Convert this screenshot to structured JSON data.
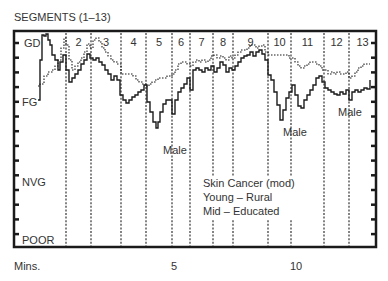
{
  "chart_data": {
    "type": "line",
    "title": "SEGMENTS (1–13)",
    "xlabel": "Mins.",
    "ylabel": "",
    "x_ticks": [
      {
        "label": "5",
        "x": 175
      },
      {
        "label": "10",
        "x": 297
      }
    ],
    "y_levels": [
      {
        "label": "GD",
        "y": 43
      },
      {
        "label": "FG",
        "y": 102
      },
      {
        "label": "NVG",
        "y": 182
      },
      {
        "label": "POOR",
        "y": 240
      }
    ],
    "segments": [
      {
        "label": "",
        "x": 14
      },
      {
        "label": "2",
        "x": 66
      },
      {
        "label": "3",
        "x": 91
      },
      {
        "label": "4",
        "x": 121
      },
      {
        "label": "5",
        "x": 146
      },
      {
        "label": "6",
        "x": 172
      },
      {
        "label": "7",
        "x": 190
      },
      {
        "label": "8",
        "x": 213
      },
      {
        "label": "9",
        "x": 233
      },
      {
        "label": "10",
        "x": 268
      },
      {
        "label": "11",
        "x": 291
      },
      {
        "label": "12",
        "x": 324
      },
      {
        "label": "13",
        "x": 349
      }
    ],
    "grid": false,
    "series": [
      {
        "name": "Male",
        "style": "solid",
        "points": [
          [
            38,
            100
          ],
          [
            40,
            60
          ],
          [
            42,
            35
          ],
          [
            44,
            36
          ],
          [
            46,
            34
          ],
          [
            48,
            40
          ],
          [
            50,
            45
          ],
          [
            52,
            55
          ],
          [
            55,
            60
          ],
          [
            58,
            70
          ],
          [
            60,
            62
          ],
          [
            63,
            55
          ],
          [
            66,
            70
          ],
          [
            69,
            82
          ],
          [
            72,
            78
          ],
          [
            75,
            74
          ],
          [
            78,
            70
          ],
          [
            81,
            64
          ],
          [
            84,
            60
          ],
          [
            87,
            54
          ],
          [
            90,
            58
          ],
          [
            93,
            60
          ],
          [
            96,
            58
          ],
          [
            99,
            62
          ],
          [
            102,
            65
          ],
          [
            105,
            70
          ],
          [
            108,
            74
          ],
          [
            111,
            80
          ],
          [
            114,
            76
          ],
          [
            117,
            80
          ],
          [
            120,
            95
          ],
          [
            123,
            100
          ],
          [
            126,
            103
          ],
          [
            129,
            100
          ],
          [
            132,
            97
          ],
          [
            135,
            95
          ],
          [
            138,
            92
          ],
          [
            141,
            90
          ],
          [
            144,
            85
          ],
          [
            147,
            102
          ],
          [
            150,
            112
          ],
          [
            153,
            122
          ],
          [
            156,
            128
          ],
          [
            158,
            122
          ],
          [
            160,
            112
          ],
          [
            163,
            104
          ],
          [
            166,
            100
          ],
          [
            169,
            100
          ],
          [
            172,
            114
          ],
          [
            175,
            100
          ],
          [
            178,
            92
          ],
          [
            181,
            88
          ],
          [
            184,
            84
          ],
          [
            187,
            78
          ],
          [
            190,
            90
          ],
          [
            193,
            70
          ],
          [
            196,
            68
          ],
          [
            199,
            70
          ],
          [
            202,
            72
          ],
          [
            205,
            68
          ],
          [
            208,
            70
          ],
          [
            211,
            66
          ],
          [
            214,
            72
          ],
          [
            217,
            68
          ],
          [
            220,
            62
          ],
          [
            223,
            65
          ],
          [
            226,
            72
          ],
          [
            229,
            68
          ],
          [
            232,
            70
          ],
          [
            235,
            66
          ],
          [
            238,
            62
          ],
          [
            241,
            58
          ],
          [
            244,
            56
          ],
          [
            247,
            55
          ],
          [
            250,
            52
          ],
          [
            253,
            56
          ],
          [
            256,
            52
          ],
          [
            259,
            50
          ],
          [
            262,
            54
          ],
          [
            265,
            60
          ],
          [
            268,
            75
          ],
          [
            271,
            80
          ],
          [
            274,
            92
          ],
          [
            277,
            105
          ],
          [
            280,
            120
          ],
          [
            283,
            110
          ],
          [
            286,
            98
          ],
          [
            289,
            92
          ],
          [
            292,
            85
          ],
          [
            295,
            95
          ],
          [
            298,
            106
          ],
          [
            301,
            108
          ],
          [
            304,
            100
          ],
          [
            307,
            95
          ],
          [
            310,
            90
          ],
          [
            313,
            85
          ],
          [
            316,
            78
          ],
          [
            319,
            76
          ],
          [
            322,
            82
          ],
          [
            325,
            88
          ],
          [
            328,
            90
          ],
          [
            331,
            92
          ],
          [
            334,
            94
          ],
          [
            337,
            95
          ],
          [
            340,
            92
          ],
          [
            343,
            94
          ],
          [
            346,
            90
          ],
          [
            349,
            100
          ],
          [
            352,
            92
          ],
          [
            355,
            90
          ],
          [
            358,
            92
          ],
          [
            361,
            90
          ],
          [
            364,
            88
          ],
          [
            367,
            89
          ],
          [
            370,
            80
          ]
        ]
      },
      {
        "name": "Overall",
        "style": "dotted",
        "points": [
          [
            38,
            86
          ],
          [
            40,
            84
          ],
          [
            44,
            76
          ],
          [
            48,
            72
          ],
          [
            52,
            70
          ],
          [
            55,
            66
          ],
          [
            58,
            60
          ],
          [
            61,
            48
          ],
          [
            64,
            38
          ],
          [
            66,
            45
          ],
          [
            69,
            60
          ],
          [
            72,
            70
          ],
          [
            75,
            66
          ],
          [
            78,
            62
          ],
          [
            81,
            58
          ],
          [
            84,
            52
          ],
          [
            87,
            44
          ],
          [
            90,
            48
          ],
          [
            93,
            40
          ],
          [
            96,
            38
          ],
          [
            99,
            42
          ],
          [
            102,
            48
          ],
          [
            105,
            52
          ],
          [
            108,
            56
          ],
          [
            111,
            60
          ],
          [
            114,
            62
          ],
          [
            117,
            64
          ],
          [
            121,
            74
          ],
          [
            124,
            74
          ],
          [
            127,
            74
          ],
          [
            130,
            74
          ],
          [
            133,
            76
          ],
          [
            136,
            80
          ],
          [
            139,
            82
          ],
          [
            142,
            84
          ],
          [
            146,
            86
          ],
          [
            149,
            84
          ],
          [
            152,
            82
          ],
          [
            155,
            80
          ],
          [
            158,
            78
          ],
          [
            161,
            78
          ],
          [
            164,
            78
          ],
          [
            167,
            76
          ],
          [
            170,
            76
          ],
          [
            172,
            74
          ],
          [
            175,
            70
          ],
          [
            178,
            64
          ],
          [
            181,
            62
          ],
          [
            184,
            62
          ],
          [
            187,
            64
          ],
          [
            190,
            66
          ],
          [
            193,
            62
          ],
          [
            196,
            60
          ],
          [
            199,
            62
          ],
          [
            202,
            60
          ],
          [
            205,
            62
          ],
          [
            208,
            60
          ],
          [
            211,
            56
          ],
          [
            214,
            55
          ],
          [
            217,
            58
          ],
          [
            220,
            56
          ],
          [
            223,
            58
          ],
          [
            226,
            60
          ],
          [
            229,
            56
          ],
          [
            232,
            58
          ],
          [
            235,
            55
          ],
          [
            238,
            52
          ],
          [
            241,
            50
          ],
          [
            244,
            50
          ],
          [
            247,
            48
          ],
          [
            250,
            45
          ],
          [
            253,
            45
          ],
          [
            256,
            48
          ],
          [
            259,
            46
          ],
          [
            262,
            45
          ],
          [
            265,
            52
          ],
          [
            268,
            55
          ],
          [
            271,
            55
          ],
          [
            274,
            55
          ],
          [
            277,
            55
          ],
          [
            280,
            55
          ],
          [
            283,
            55
          ],
          [
            286,
            55
          ],
          [
            289,
            58
          ],
          [
            292,
            58
          ],
          [
            295,
            62
          ],
          [
            298,
            66
          ],
          [
            301,
            68
          ],
          [
            304,
            66
          ],
          [
            307,
            64
          ],
          [
            310,
            62
          ],
          [
            313,
            62
          ],
          [
            316,
            64
          ],
          [
            319,
            66
          ],
          [
            322,
            70
          ],
          [
            325,
            70
          ],
          [
            328,
            74
          ],
          [
            331,
            72
          ],
          [
            334,
            74
          ],
          [
            337,
            72
          ],
          [
            340,
            74
          ],
          [
            343,
            74
          ],
          [
            346,
            72
          ],
          [
            349,
            78
          ],
          [
            352,
            76
          ],
          [
            355,
            72
          ],
          [
            358,
            68
          ],
          [
            361,
            66
          ],
          [
            364,
            64
          ],
          [
            367,
            64
          ],
          [
            370,
            64
          ]
        ]
      }
    ],
    "annotations": [
      {
        "text": "Male",
        "x": 163,
        "y": 154
      },
      {
        "text": "Male",
        "x": 283,
        "y": 136
      },
      {
        "text": "Male",
        "x": 338,
        "y": 116
      },
      {
        "text": "Skin Cancer (mod)",
        "x": 203,
        "y": 187
      },
      {
        "text": "Young – Rural",
        "x": 203,
        "y": 201
      },
      {
        "text": "Mid – Educated",
        "x": 203,
        "y": 215
      }
    ],
    "frame": {
      "x0": 14,
      "y0": 31,
      "x1": 376,
      "y1": 247
    }
  },
  "labels": {
    "title": "SEGMENTS (1–13)",
    "xlabel": "Mins.",
    "tick_5": "5",
    "tick_10": "10",
    "y_gd": "GD",
    "y_fg": "FG",
    "y_nvg": "NVG",
    "y_poor": "POOR",
    "male_1": "Male",
    "male_2": "Male",
    "male_3": "Male",
    "note_1": "Skin Cancer (mod)",
    "note_2": "Young – Rural",
    "note_3": "Mid – Educated"
  }
}
